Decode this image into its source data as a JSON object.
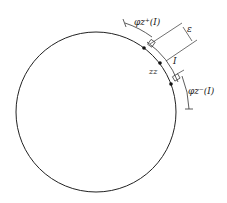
{
  "diagram": {
    "circle": {
      "cx": 96,
      "cy": 112,
      "r": 80,
      "stroke": "#222222"
    },
    "labels": {
      "phi_plus": "φz⁺(I)",
      "phi_minus": "φz⁻(I)",
      "epsilon": "ε",
      "interval": "I",
      "point": "zz"
    },
    "points": [
      {
        "name": "left-endpoint",
        "x": 144,
        "y": 48
      },
      {
        "name": "z",
        "x": 160,
        "y": 63
      },
      {
        "name": "right-endpoint",
        "x": 171,
        "y": 84
      }
    ]
  }
}
